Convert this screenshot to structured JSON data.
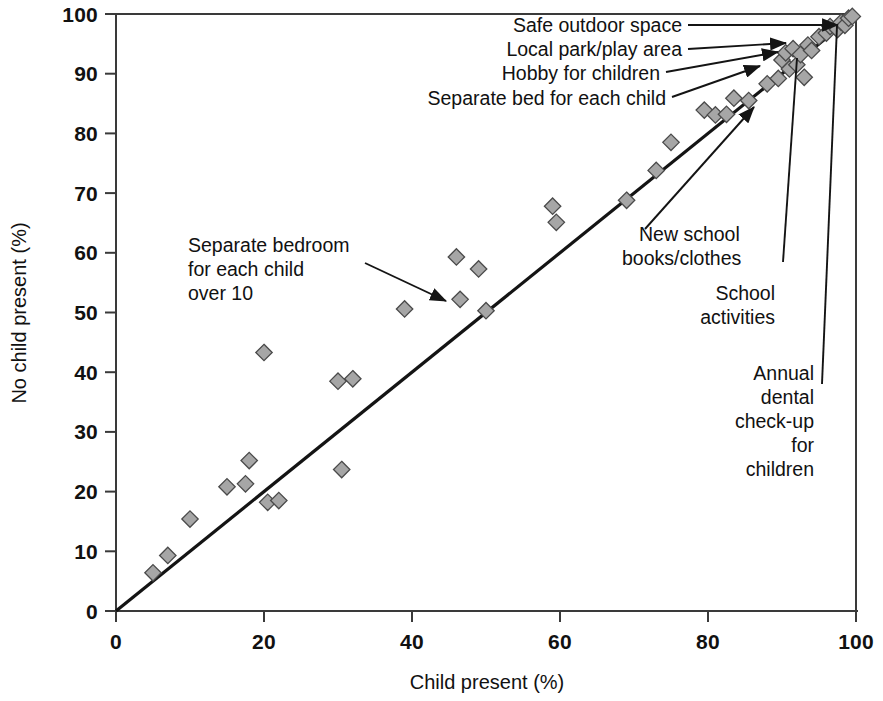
{
  "chart_data": {
    "type": "scatter",
    "title": "",
    "xlabel": "Child present (%)",
    "ylabel": "No child present (%)",
    "xlim": [
      0,
      100
    ],
    "ylim": [
      0,
      100
    ],
    "xticks": [
      0,
      20,
      40,
      60,
      80,
      100
    ],
    "yticks": [
      0,
      10,
      20,
      30,
      40,
      50,
      60,
      70,
      80,
      90,
      100
    ],
    "grid": false,
    "legend": "none",
    "reference_line": {
      "name": "equality-line",
      "from": [
        0,
        0
      ],
      "to": [
        100,
        100
      ],
      "description": "45 degree line of equality"
    },
    "marker_style": {
      "shape": "diamond",
      "fill": "#a6a6a6",
      "stroke": "#4a4a4a"
    },
    "series": [
      {
        "name": "Deprivation items",
        "points": [
          [
            5,
            6.4
          ],
          [
            7,
            9.3
          ],
          [
            10,
            15.4
          ],
          [
            15,
            20.8
          ],
          [
            17.5,
            21.3
          ],
          [
            18,
            25.2
          ],
          [
            20,
            43.3
          ],
          [
            20.5,
            18.2
          ],
          [
            22,
            18.5
          ],
          [
            30,
            38.5
          ],
          [
            30.5,
            23.7
          ],
          [
            32,
            38.9
          ],
          [
            39,
            50.6
          ],
          [
            46,
            59.3
          ],
          [
            46.5,
            52.2
          ],
          [
            49,
            57.3
          ],
          [
            50,
            50.3
          ],
          [
            59,
            67.8
          ],
          [
            59.5,
            65.1
          ],
          [
            69,
            68.8
          ],
          [
            73,
            73.8
          ],
          [
            75,
            78.5
          ],
          [
            79.5,
            83.9
          ],
          [
            81,
            83.1
          ],
          [
            82.5,
            83.2
          ],
          [
            83.5,
            85.9
          ],
          [
            85.5,
            85.5
          ],
          [
            88,
            88.3
          ],
          [
            89.5,
            89.2
          ],
          [
            90,
            92.3
          ],
          [
            90.5,
            93.5
          ],
          [
            91,
            90.8
          ],
          [
            91.5,
            94.2
          ],
          [
            92,
            91.5
          ],
          [
            92.5,
            93.2
          ],
          [
            93,
            89.4
          ],
          [
            93.5,
            94.8
          ],
          [
            94,
            93.9
          ],
          [
            95,
            96.2
          ],
          [
            96,
            96.8
          ],
          [
            96.5,
            97.9
          ],
          [
            97.5,
            97.4
          ],
          [
            98,
            98.6
          ],
          [
            98.5,
            98.1
          ],
          [
            99,
            99.3
          ],
          [
            99.5,
            99.6
          ]
        ]
      }
    ],
    "annotations": [
      {
        "id": "safe-outdoor-space",
        "text": "Safe outdoor space",
        "target": [
          97.8,
          99.4
        ],
        "style": "horizontal-arrow"
      },
      {
        "id": "local-park-play-area",
        "text": "Local park/play area",
        "target": [
          93.6,
          95.1
        ],
        "style": "horizontal-arrow"
      },
      {
        "id": "hobby-for-children",
        "text": "Hobby for children",
        "target": [
          91.2,
          92.6
        ],
        "style": "diagonal-arrow"
      },
      {
        "id": "separate-bed-for-each-child",
        "text": "Separate bed for each child",
        "target": [
          84.2,
          86.1
        ],
        "style": "diagonal-arrow"
      },
      {
        "id": "separate-bedroom-for-each-child-over-10",
        "lines": [
          "Separate bedroom",
          "for each child",
          "over 10"
        ],
        "text": "Separate bedroom for each child over 10",
        "target": [
          46.3,
          52.4
        ],
        "style": "diagonal-arrow"
      },
      {
        "id": "new-school-books-clothes",
        "lines": [
          "New school",
          "books/clothes"
        ],
        "text": "New school books/clothes",
        "target": [
          89.3,
          89.9
        ],
        "style": "diagonal-arrow"
      },
      {
        "id": "school-activities",
        "lines": [
          "School",
          "activities"
        ],
        "text": "School activities",
        "target": [
          91.9,
          93.0
        ],
        "style": "vertical-line"
      },
      {
        "id": "annual-dental-check-up-for-children",
        "lines": [
          "Annual",
          "dental",
          "check-up",
          "for",
          "children"
        ],
        "text": "Annual dental check-up for children",
        "target": [
          97.2,
          97.6
        ],
        "style": "vertical-line"
      }
    ]
  },
  "axes": {
    "x_title": "Child present (%)",
    "y_title": "No child present (%)",
    "x_tick_labels": [
      "0",
      "20",
      "40",
      "60",
      "80",
      "100"
    ],
    "y_tick_labels": [
      "0",
      "10",
      "20",
      "30",
      "40",
      "50",
      "60",
      "70",
      "80",
      "90",
      "100"
    ]
  },
  "annotation_text": {
    "safe_outdoor_space": "Safe outdoor space",
    "local_park_play_area": "Local park/play area",
    "hobby_for_children": "Hobby for children",
    "separate_bed_for_each_child": "Separate bed for each child",
    "separate_bedroom_l1": "Separate bedroom",
    "separate_bedroom_l2": "for each child",
    "separate_bedroom_l3": "over 10",
    "new_school_l1": "New school",
    "new_school_l2": "books/clothes",
    "school_activities_l1": "School",
    "school_activities_l2": "activities",
    "annual_dental_l1": "Annual",
    "annual_dental_l2": "dental",
    "annual_dental_l3": "check-up",
    "annual_dental_l4": "for",
    "annual_dental_l5": "children"
  },
  "colors": {
    "marker_fill": "#a6a6a6",
    "marker_stroke": "#4a4a4a",
    "line": "#141414",
    "axis": "#3a3a3a",
    "text": "#111111",
    "background": "#ffffff"
  }
}
